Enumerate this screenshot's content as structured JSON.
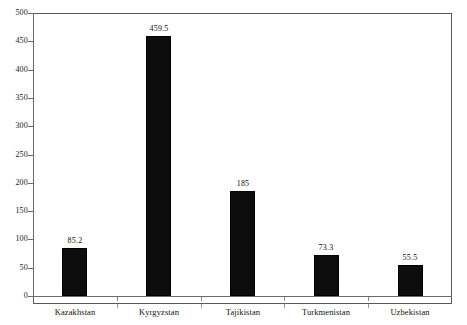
{
  "chart_data": {
    "type": "bar",
    "title": "",
    "subtitle": "",
    "xlabel": "",
    "ylabel": "",
    "categories": [
      "Kazakhstan",
      "Kyrgyzstan",
      "Tajikistan",
      "Turkmenistan",
      "Uzbekistan"
    ],
    "values": [
      85.2,
      459.5,
      185,
      73.3,
      55.5
    ],
    "value_labels": [
      "85.2",
      "459.5",
      "185",
      "73.3",
      "55.5"
    ],
    "ylim": [
      0,
      500
    ],
    "ytick_step": 50,
    "ytick_labels": [
      "0",
      "50",
      "100",
      "150",
      "200",
      "250",
      "300",
      "350",
      "400",
      "450",
      "500"
    ],
    "ytick_values": [
      0,
      50,
      100,
      150,
      200,
      250,
      300,
      350,
      400,
      450,
      500
    ],
    "grid": false,
    "legend": false,
    "legend_position": "none",
    "bar_color": "#0d0d0d",
    "axis_color": "#6a6a6a",
    "frame_color": "#5a5a5a",
    "background_color": "#ffffff",
    "orientation": "vertical"
  }
}
